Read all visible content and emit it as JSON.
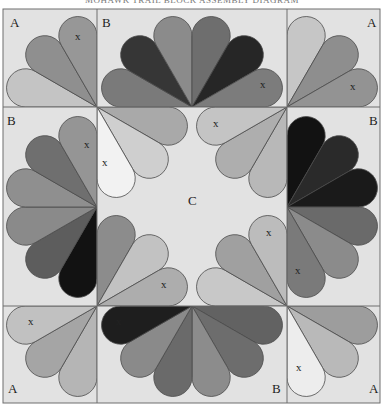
{
  "title": "MOHAWK TRAIL BLOCK ASSEMBLY DIAGRAM",
  "colors": {
    "background": "#e2e2e2",
    "grid_line": "#6e6e6e",
    "petal_outline": "#4a4a4a"
  },
  "grid": {
    "x": [
      3,
      97,
      287,
      380
    ],
    "y": [
      9,
      107,
      306,
      403
    ]
  },
  "petal_radius": 93,
  "blocks": [
    {
      "id": "top-left",
      "label": "A",
      "label_pos": [
        10,
        27
      ]
    },
    {
      "id": "top-center",
      "label": "B",
      "label_pos": [
        102,
        27
      ]
    },
    {
      "id": "top-right",
      "label": "A",
      "label_pos": [
        367,
        27
      ]
    },
    {
      "id": "middle-left",
      "label": "B",
      "label_pos": [
        7,
        125
      ]
    },
    {
      "id": "center",
      "label": "C",
      "label_pos": [
        188,
        205
      ]
    },
    {
      "id": "middle-right",
      "label": "B",
      "label_pos": [
        369,
        125
      ]
    },
    {
      "id": "bottom-left",
      "label": "A",
      "label_pos": [
        8,
        393
      ]
    },
    {
      "id": "bottom-center",
      "label": "B",
      "label_pos": [
        272,
        393
      ]
    },
    {
      "id": "bottom-right",
      "label": "A",
      "label_pos": [
        369,
        393
      ]
    }
  ],
  "fans": [
    {
      "name": "fan-top-left-A",
      "center": [
        97,
        107
      ],
      "start": 180,
      "end": 270,
      "colors": [
        "#c4c4c4",
        "#8f8f8f",
        "#979797"
      ]
    },
    {
      "name": "fan-top-right-A",
      "center": [
        287,
        107
      ],
      "start": 270,
      "end": 360,
      "colors": [
        "#c6c6c6",
        "#8e8e8e",
        "#939393"
      ]
    },
    {
      "name": "fan-bottom-left-A",
      "center": [
        97,
        306
      ],
      "start": 90,
      "end": 180,
      "colors": [
        "#b5b5b5",
        "#a5a5a5",
        "#c1c1c1"
      ]
    },
    {
      "name": "fan-bottom-right-A",
      "center": [
        287,
        306
      ],
      "start": 0,
      "end": 90,
      "colors": [
        "#9d9d9d",
        "#b9b9b9",
        "#ededed"
      ]
    },
    {
      "name": "fan-top-B",
      "center": [
        192,
        107
      ],
      "start": 180,
      "end": 360,
      "colors": [
        "#7a7a7a",
        "#363636",
        "#8b8b8b",
        "#6e6e6e",
        "#262626",
        "#7c7c7c"
      ]
    },
    {
      "name": "fan-bottom-B",
      "center": [
        192,
        306
      ],
      "start": 0,
      "end": 180,
      "colors": [
        "#626262",
        "#6d6d6d",
        "#8c8c8c",
        "#6a6a6a",
        "#8a8a8a",
        "#1e1e1e"
      ]
    },
    {
      "name": "fan-left-B",
      "center": [
        97,
        207
      ],
      "start": 90,
      "end": 270,
      "colors": [
        "#121212",
        "#5d5d5d",
        "#8a8a8a",
        "#8f8f8f",
        "#6f6f6f",
        "#959595"
      ]
    },
    {
      "name": "fan-right-B",
      "center": [
        287,
        207
      ],
      "start": 270,
      "end": 450,
      "colors": [
        "#121212",
        "#2a2a2a",
        "#1a1a1a",
        "#6a6a6a",
        "#8b8b8b",
        "#7a7a7a"
      ]
    },
    {
      "name": "fan-C-top-left",
      "center": [
        97,
        107
      ],
      "start": 0,
      "end": 90,
      "colors": [
        "#a9a9a9",
        "#cfcfcf",
        "#f2f2f2"
      ]
    },
    {
      "name": "fan-C-top-right",
      "center": [
        287,
        107
      ],
      "start": 90,
      "end": 180,
      "colors": [
        "#b8b8b8",
        "#aeaeae",
        "#c4c4c4"
      ]
    },
    {
      "name": "fan-C-bottom-left",
      "center": [
        97,
        306
      ],
      "start": 270,
      "end": 360,
      "colors": [
        "#8c8c8c",
        "#c2c2c2",
        "#adadad"
      ]
    },
    {
      "name": "fan-C-bottom-right",
      "center": [
        287,
        306
      ],
      "start": 180,
      "end": 270,
      "colors": [
        "#c8c8c8",
        "#a0a0a0",
        "#bcbcbc"
      ]
    }
  ],
  "x_marks": [
    {
      "pos": [
        75,
        40
      ]
    },
    {
      "pos": [
        260,
        88
      ]
    },
    {
      "pos": [
        350,
        90
      ]
    },
    {
      "pos": [
        84,
        148
      ]
    },
    {
      "pos": [
        102,
        166
      ]
    },
    {
      "pos": [
        213,
        127
      ]
    },
    {
      "pos": [
        266,
        236
      ]
    },
    {
      "pos": [
        295,
        274
      ]
    },
    {
      "pos": [
        161,
        288
      ]
    },
    {
      "pos": [
        28,
        325
      ]
    },
    {
      "pos": [
        116,
        325
      ]
    },
    {
      "pos": [
        296,
        371
      ]
    }
  ],
  "x_label": "x"
}
